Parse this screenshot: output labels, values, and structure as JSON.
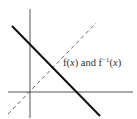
{
  "diagram": {
    "type": "function-and-inverse-graph",
    "label": {
      "f_prefix": "f(",
      "var1": "x",
      "mid": ") and f",
      "exponent": "−1",
      "open2": "(",
      "var2": "x",
      "close": ")"
    },
    "axes": {
      "color": "#555555"
    },
    "function_line": {
      "style": "solid",
      "color": "#111111",
      "description": "decreasing line f(x)"
    },
    "identity_line": {
      "style": "dashed",
      "color": "#666666",
      "description": "line y = x"
    }
  }
}
